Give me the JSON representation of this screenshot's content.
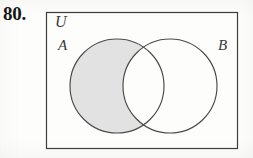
{
  "figure": {
    "problem_number": "80.",
    "universe_label": "U",
    "set_a_label": "A",
    "set_b_label": "B",
    "shaded_region_description": "A minus B",
    "colors": {
      "shading": "#e2e2e2",
      "stroke": "#4a4a4a",
      "rectangle_stroke": "#3d3d3d",
      "label_text": "#3a3a3a",
      "number_text": "#151515",
      "background": "#fdfdfc"
    },
    "geometry": {
      "rectangle": {
        "x": 46,
        "y": 12,
        "width": 191,
        "height": 136
      },
      "circle_a": {
        "cx": 117,
        "cy": 86,
        "r": 47
      },
      "circle_b": {
        "cx": 170,
        "cy": 86,
        "r": 47
      }
    }
  }
}
